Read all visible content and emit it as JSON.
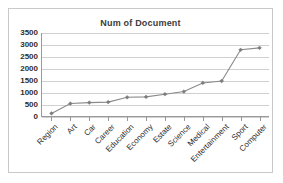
{
  "chart_data": {
    "type": "line",
    "title": "Num of Document",
    "xlabel": "",
    "ylabel": "",
    "categories": [
      "Region",
      "Art",
      "Car",
      "Career",
      "Education",
      "Economy",
      "Estate",
      "Science",
      "Medical",
      "Entertainment",
      "Sport",
      "Computer"
    ],
    "values": [
      150,
      560,
      600,
      620,
      820,
      840,
      950,
      1060,
      1420,
      1500,
      2800,
      2880
    ],
    "series": [
      {
        "name": "Num of Document",
        "values": [
          150,
          560,
          600,
          620,
          820,
          840,
          950,
          1060,
          1420,
          1500,
          2800,
          2880
        ]
      }
    ],
    "ylim": [
      0,
      3500
    ],
    "ytick_step": 500,
    "yticks": [
      0,
      500,
      1000,
      1500,
      2000,
      2500,
      3000,
      3500
    ],
    "ytick_labels": [
      "0",
      "500",
      "1000",
      "1500",
      "2000",
      "2500",
      "3000",
      "3500"
    ],
    "grid": true,
    "legend": false,
    "legend_position": "none",
    "marker": "diamond",
    "xtick_label_rotation": -45,
    "colors": {
      "line": "#8a8a8a",
      "marker": "#7d7d7d",
      "gridline": "#d0d0d0",
      "axis": "#9a9a9a",
      "text": "#2b2b2b",
      "title": "#3b3b3b",
      "border": "#c9c9c9",
      "background": "#ffffff"
    }
  }
}
